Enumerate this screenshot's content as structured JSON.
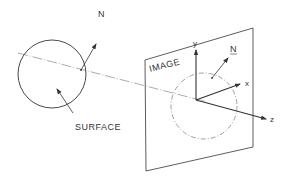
{
  "diagram": {
    "labels": {
      "surface_normal": "N",
      "surface": "SURFACE",
      "image_plane": "IMAGE",
      "image_normal": "N",
      "axis_x": "x",
      "axis_y": "y",
      "axis_z": "z"
    },
    "colors": {
      "stroke": "#333333",
      "dashed": "#666666",
      "background": "#ffffff"
    }
  }
}
